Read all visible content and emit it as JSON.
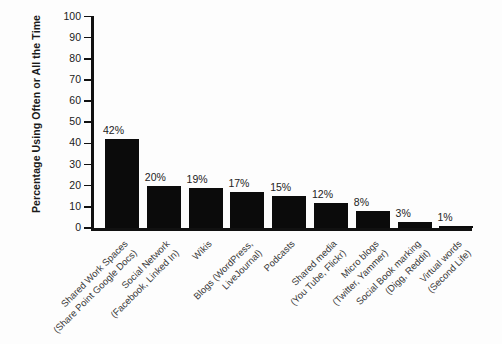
{
  "chart_data": {
    "type": "bar",
    "title": "",
    "xlabel": "",
    "ylabel": "Percentage Using Often or All the Time",
    "ylim": [
      0,
      100
    ],
    "ytick_values": [
      0,
      10,
      20,
      30,
      40,
      50,
      60,
      70,
      80,
      90,
      100
    ],
    "ytick_labels": [
      "0",
      "10",
      "20",
      "30",
      "40",
      "50",
      "60",
      "70",
      "80",
      "90",
      "100"
    ],
    "grid": false,
    "legend": false,
    "bar_color": "#0b0b0b",
    "categories": [
      "Shared Work  Spaces (Share Point Google Docs)",
      "Social Network (Facebook, Linked In)",
      "Wikis",
      "Blogs (WordPress, LiveJournal)",
      "Podcasts",
      "Shared media (You Tube, Flickr)",
      "Micro blogs (Twitter, Yammer)",
      "Social Book marking (Digg, Reddit)",
      "Virtual words (Second Life)"
    ],
    "category_lines": [
      {
        "line1": "Shared Work  Spaces",
        "line2": "(Share Point Google Docs)"
      },
      {
        "line1": "Social Network",
        "line2": "(Facebook, Linked In)"
      },
      {
        "line1": "Wikis",
        "line2": ""
      },
      {
        "line1": "Blogs (WordPress,",
        "line2": "LiveJournal)"
      },
      {
        "line1": "Podcasts",
        "line2": ""
      },
      {
        "line1": "Shared media",
        "line2": "(You Tube, Flickr)"
      },
      {
        "line1": "Micro blogs",
        "line2": "(Twitter, Yammer)"
      },
      {
        "line1": "Social Book marking",
        "line2": "(Digg, Reddit)"
      },
      {
        "line1": "Virtual words",
        "line2": "(Second Life)"
      }
    ],
    "values": [
      42,
      20,
      19,
      17,
      15,
      12,
      8,
      3,
      1
    ],
    "value_labels": [
      "42%",
      "20%",
      "19%",
      "17%",
      "15%",
      "12%",
      "8%",
      "3%",
      "1%"
    ]
  }
}
